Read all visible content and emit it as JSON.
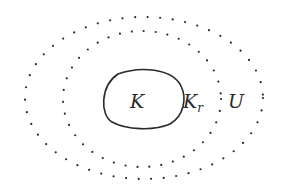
{
  "diagram": {
    "sets": [
      {
        "id": "K",
        "label": "K",
        "style": "solid"
      },
      {
        "id": "K_r",
        "label": "K",
        "subscript": "r",
        "style": "dotted"
      },
      {
        "id": "U",
        "label": "U",
        "style": "dotted"
      }
    ],
    "relation": "K ⊂ K_r ⊂ U (nested regions)",
    "colors": {
      "stroke": "#2a2a2a",
      "background": "#ffffff"
    }
  }
}
